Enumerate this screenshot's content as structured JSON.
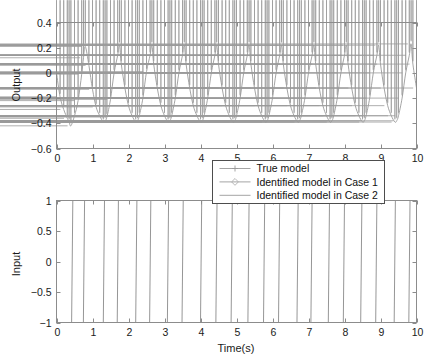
{
  "figure": {
    "background": "#ffffff",
    "line_color": "#9a9a9a",
    "axis_color": "#8c8c8c",
    "text_color": "#1a1a1a"
  },
  "legend": {
    "position": "between-plots-right",
    "entries": [
      {
        "label": "True model",
        "marker": "plus",
        "color": "#9a9a9a"
      },
      {
        "label": "Identified model in Case 1",
        "marker": "diamond",
        "color": "#b0b0b0"
      },
      {
        "label": "Identified model in Case 2",
        "marker": "none",
        "color": "#9a9a9a"
      }
    ]
  },
  "chart_data": [
    {
      "type": "line",
      "id": "output-plot",
      "title": "",
      "xlabel": "",
      "ylabel": "Output",
      "xlim": [
        0,
        10
      ],
      "ylim": [
        -0.6,
        0.4
      ],
      "xticks": [
        0,
        1,
        2,
        3,
        4,
        5,
        6,
        7,
        8,
        9,
        10
      ],
      "xticklabels": [
        "0",
        "1",
        "2",
        "3",
        "4",
        "5",
        "6",
        "7",
        "8",
        "9",
        "10"
      ],
      "yticks": [
        -0.6,
        -0.4,
        -0.2,
        0,
        0.2,
        0.4
      ],
      "yticklabels": [
        "-0.6",
        "-0.4",
        "-0.2",
        "0",
        "0.2",
        "0.4"
      ],
      "grid": false,
      "marker": "diamond-plus",
      "series": [
        {
          "name": "True model",
          "x": [
            0,
            0.1,
            0.2,
            0.3,
            0.35,
            0.4,
            0.5,
            0.6,
            0.7,
            0.75,
            0.8,
            0.9,
            1.0,
            1.1,
            1.2,
            1.3,
            1.35,
            1.4,
            1.5,
            1.6,
            1.7,
            1.75,
            1.8,
            1.9,
            2.0,
            2.1,
            2.2,
            2.25,
            2.3,
            2.4,
            2.5,
            2.6,
            2.65,
            2.7,
            2.8,
            2.9,
            3.0,
            3.1,
            3.15,
            3.2,
            3.3,
            3.4,
            3.5,
            3.55,
            3.6,
            3.7,
            3.8,
            3.9,
            4.0,
            4.05,
            4.1,
            4.2,
            4.3,
            4.4,
            4.45,
            4.5,
            4.6,
            4.7,
            4.8,
            4.9,
            4.95,
            5.0,
            5.1,
            5.2,
            5.3,
            5.35,
            5.4,
            5.5,
            5.6,
            5.7,
            5.8,
            5.85,
            5.9,
            6.0,
            6.1,
            6.2,
            6.25,
            6.3,
            6.4,
            6.5,
            6.6,
            6.7,
            6.75,
            6.8,
            6.9,
            7.0,
            7.1,
            7.15,
            7.2,
            7.3,
            7.4,
            7.5,
            7.6,
            7.65,
            7.7,
            7.8,
            7.9,
            8.0,
            8.05,
            8.1,
            8.2,
            8.3,
            8.4,
            8.5,
            8.55,
            8.6,
            8.7,
            8.8,
            8.9,
            8.95,
            9.0,
            9.1,
            9.2,
            9.3,
            9.4,
            9.45,
            9.5,
            9.6,
            9.7,
            9.8,
            9.85,
            9.9,
            10.0
          ],
          "y": [
            0.0,
            -0.19,
            -0.29,
            -0.36,
            -0.39,
            -0.42,
            -0.34,
            -0.22,
            -0.01,
            0.12,
            0.21,
            0.06,
            -0.13,
            -0.27,
            -0.34,
            -0.39,
            -0.38,
            -0.35,
            -0.21,
            0.0,
            0.14,
            0.22,
            0.07,
            -0.12,
            -0.26,
            -0.34,
            -0.39,
            -0.38,
            -0.34,
            -0.2,
            0.01,
            0.14,
            0.22,
            0.07,
            -0.12,
            -0.26,
            -0.34,
            -0.39,
            -0.38,
            -0.34,
            -0.2,
            0.0,
            0.14,
            0.22,
            0.07,
            -0.12,
            -0.26,
            -0.34,
            -0.39,
            -0.38,
            -0.34,
            -0.2,
            0.0,
            0.14,
            0.22,
            0.07,
            -0.12,
            -0.26,
            -0.34,
            -0.39,
            -0.38,
            -0.34,
            -0.2,
            0.0,
            0.14,
            0.22,
            0.07,
            -0.12,
            -0.26,
            -0.34,
            -0.39,
            -0.38,
            -0.34,
            -0.2,
            0.0,
            0.14,
            0.22,
            0.07,
            -0.12,
            -0.26,
            -0.34,
            -0.39,
            -0.38,
            -0.34,
            -0.2,
            0.0,
            0.14,
            0.22,
            0.07,
            -0.12,
            -0.26,
            -0.34,
            -0.39,
            -0.38,
            -0.34,
            -0.2,
            0.0,
            0.14,
            0.22,
            0.07,
            -0.12,
            -0.26,
            -0.34,
            -0.39,
            -0.38,
            -0.34,
            -0.2,
            0.0,
            0.14,
            0.22,
            0.07,
            -0.12,
            -0.26,
            -0.34,
            -0.39,
            -0.38,
            -0.34,
            -0.2,
            0.0,
            0.14,
            0.23,
            0.07,
            -0.12
          ]
        }
      ]
    },
    {
      "type": "line",
      "id": "input-plot",
      "title": "",
      "xlabel": "Time(s)",
      "ylabel": "Input",
      "xlim": [
        0,
        10
      ],
      "ylim": [
        -1,
        1
      ],
      "xticks": [
        0,
        1,
        2,
        3,
        4,
        5,
        6,
        7,
        8,
        9,
        10
      ],
      "xticklabels": [
        "0",
        "1",
        "2",
        "3",
        "4",
        "5",
        "6",
        "7",
        "8",
        "9",
        "10"
      ],
      "yticks": [
        -1,
        -0.5,
        0,
        0.5,
        1
      ],
      "yticklabels": [
        "-1",
        "-0.5",
        "0",
        "0.5",
        "1"
      ],
      "grid": false,
      "waveform": "prbs-square",
      "series": [
        {
          "name": "Input",
          "transitions": [
            0.0,
            0.42,
            0.78,
            1.3,
            1.72,
            2.2,
            2.62,
            3.08,
            3.52,
            4.0,
            4.46,
            4.85,
            5.35,
            5.75,
            6.2,
            6.68,
            7.1,
            7.55,
            8.0,
            8.45,
            8.9,
            9.38,
            9.82,
            10.0
          ],
          "levels": [
            1,
            -1,
            1,
            -1,
            1,
            -1,
            1,
            -1,
            1,
            -1,
            1,
            -1,
            1,
            -1,
            1,
            -1,
            1,
            -1,
            1,
            -1,
            1,
            -1,
            1
          ],
          "amplitude": 1
        }
      ]
    }
  ]
}
